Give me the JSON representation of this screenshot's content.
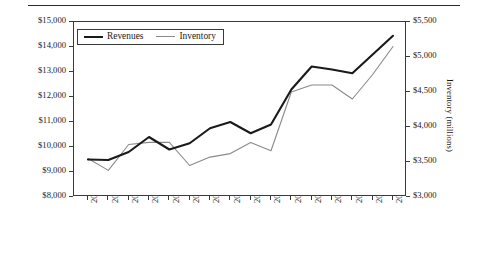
{
  "chart_data": {
    "type": "line",
    "title": "",
    "xlabel": "",
    "grid": false,
    "legend_position": "top-left",
    "categories": [
      "2001.Mar",
      "2001.Jun",
      "2001.Sep",
      "2001.Dec",
      "2002.Mar",
      "2002.Jun",
      "2002.Sep",
      "2002.Dec",
      "2003.Mar",
      "2003.Jun",
      "2003.Sep",
      "2003.Dec",
      "2004.Mar",
      "2004.Jun",
      "2004.Sep",
      "2004.Dec"
    ],
    "series": [
      {
        "name": "Revenues",
        "axis": "left",
        "color": "#1a1a1a",
        "values": [
          9500,
          9480,
          9800,
          10400,
          9900,
          10150,
          10750,
          11000,
          10550,
          10900,
          12300,
          13220,
          13100,
          12950,
          13700,
          14450
        ]
      },
      {
        "name": "Inventory",
        "axis": "right",
        "color": "#8a8a8a",
        "values": [
          3550,
          3380,
          3750,
          3780,
          3780,
          3450,
          3570,
          3620,
          3780,
          3660,
          4500,
          4600,
          4600,
          4400,
          4750,
          5150
        ]
      }
    ],
    "left_axis": {
      "label": "Revenues (millions)",
      "ylim": [
        8000,
        15000
      ],
      "ticks": [
        8000,
        9000,
        10000,
        11000,
        12000,
        13000,
        14000,
        15000
      ],
      "tick_labels": [
        "$8,000",
        "$9,000",
        "$10,000",
        "$11,000",
        "$12,000",
        "$13,000",
        "$14,000",
        "$15,000"
      ]
    },
    "right_axis": {
      "label": "Inventory (millions)",
      "ylim": [
        3000,
        5500
      ],
      "ticks": [
        3000,
        3500,
        4000,
        4500,
        5000,
        5500
      ],
      "tick_labels": [
        "$3,000",
        "$3,500",
        "$4,000",
        "$4,500",
        "$5,000",
        "$5,500"
      ]
    }
  },
  "legend": {
    "items": [
      {
        "label": "Revenues"
      },
      {
        "label": "Inventory"
      }
    ]
  }
}
